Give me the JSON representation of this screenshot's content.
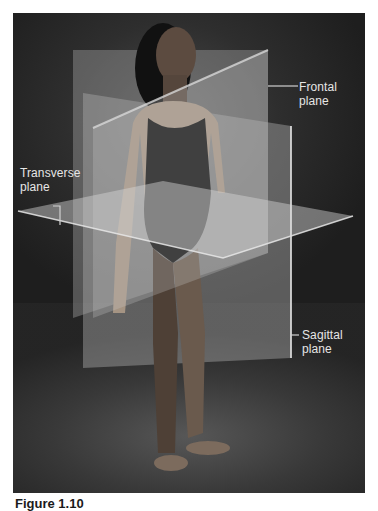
{
  "figure": {
    "labels": {
      "frontal": [
        "Frontal",
        "plane"
      ],
      "transverse": [
        "Transverse",
        "plane"
      ],
      "sagittal": [
        "Sagittal",
        "plane"
      ]
    },
    "caption": {
      "figure_number": "Figure 1.10",
      "text": "(cut off)"
    }
  },
  "colors": {
    "background": "#2a2a2a",
    "plane_fill": "#bdbdbd",
    "label_text": "#e6e6e6",
    "leader_line": "#d0d0d0"
  }
}
